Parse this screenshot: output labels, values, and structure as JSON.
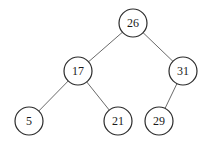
{
  "diagram": {
    "type": "binary-search-tree",
    "root": "26",
    "nodes": [
      {
        "id": "n26",
        "label": "26"
      },
      {
        "id": "n17",
        "label": "17"
      },
      {
        "id": "n31",
        "label": "31"
      },
      {
        "id": "n5",
        "label": "5"
      },
      {
        "id": "n21",
        "label": "21"
      },
      {
        "id": "n29",
        "label": "29"
      }
    ],
    "edges": [
      {
        "from": "n26",
        "to": "n17"
      },
      {
        "from": "n26",
        "to": "n31"
      },
      {
        "from": "n17",
        "to": "n5"
      },
      {
        "from": "n17",
        "to": "n21"
      },
      {
        "from": "n31",
        "to": "n29"
      }
    ]
  }
}
